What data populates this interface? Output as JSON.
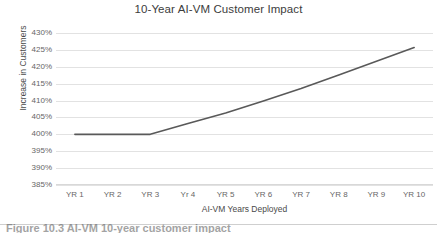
{
  "chart_data": {
    "type": "line",
    "title": "10-Year AI-VM Customer Impact",
    "xlabel": "AI-VM Years Deployed",
    "ylabel": "Increase in Customers",
    "categories": [
      "YR 1",
      "YR 2",
      "YR 3",
      "Yr 4",
      "YR 5",
      "YR 6",
      "YR 7",
      "YR 8",
      "YR 9",
      "YR 10"
    ],
    "values": [
      400,
      400,
      400,
      403.2,
      406.3,
      409.9,
      413.6,
      417.6,
      421.6,
      425.7
    ],
    "ytick_labels": [
      "430%",
      "425%",
      "420%",
      "415%",
      "410%",
      "405%",
      "400%",
      "395%",
      "390%",
      "385%"
    ],
    "ytick_values": [
      430,
      425,
      420,
      415,
      410,
      405,
      400,
      395,
      390,
      385
    ],
    "ylim": [
      385,
      430
    ],
    "yunit": "%",
    "grid": true,
    "legend": "none",
    "series_color": "#595959",
    "grid_color": "#e2e2e2",
    "axis_text_color": "#666666",
    "title_color": "#3c3c3c",
    "background": "#ffffff"
  },
  "caption": {
    "text": "Figure 10.3   AI-VM 10-year customer impact"
  }
}
